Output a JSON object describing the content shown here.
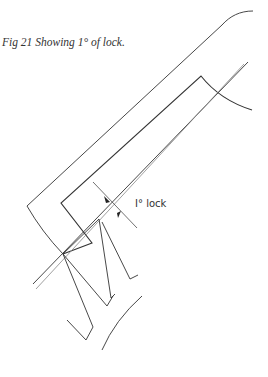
{
  "figure": {
    "caption": "Fig 21  Showing 1° of lock.",
    "annotation_label": "I° lock",
    "line_color": "#333333",
    "parts": [
      "pallet-outer-outline",
      "pallet-inner-outline",
      "pallet-face-lines",
      "escape-wheel-teeth",
      "wheel-rim-arc",
      "lock-angle-dimension"
    ]
  }
}
